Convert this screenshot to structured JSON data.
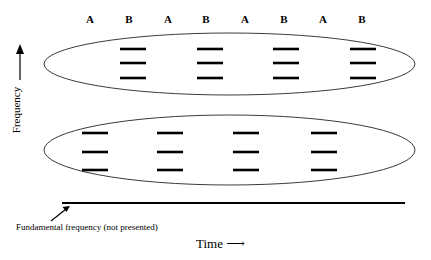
{
  "figure": {
    "type": "diagram",
    "axes": {
      "y_label": "Frequency",
      "y_arrow": "up-arrow",
      "x_label": "Time",
      "x_arrow": "right-arrow",
      "baseline_note": "Fundamental frequency (not presented)",
      "baseline": {
        "x1": 62,
        "x2": 405,
        "y": 203
      }
    },
    "column_labels": [
      {
        "text": "A",
        "x": 90
      },
      {
        "text": "B",
        "x": 129
      },
      {
        "text": "A",
        "x": 168
      },
      {
        "text": "B",
        "x": 206
      },
      {
        "text": "A",
        "x": 245
      },
      {
        "text": "B",
        "x": 284
      },
      {
        "text": "A",
        "x": 323
      },
      {
        "text": "B",
        "x": 362
      }
    ],
    "label_row_y": 14,
    "ellipses": [
      {
        "name": "upper-harmonic-band",
        "cx": 229.5,
        "cy": 64,
        "rx": 185.5,
        "ry": 31
      },
      {
        "name": "lower-harmonic-band",
        "cx": 229.5,
        "cy": 150,
        "rx": 185.5,
        "ry": 35
      }
    ],
    "harmonic_groups": [
      {
        "band": "upper",
        "assigned_label": "B",
        "dash_x_start": 120,
        "dash_length": 26,
        "dash_y": [
          49,
          63,
          78
        ],
        "group_x_starts": [
          120,
          197,
          273,
          350
        ]
      },
      {
        "band": "lower",
        "assigned_label": "A",
        "dash_x_start": 82,
        "dash_length": 26,
        "dash_y": [
          133,
          152,
          170
        ],
        "group_x_starts": [
          82,
          157,
          233,
          311
        ]
      }
    ],
    "pointer_arrow": {
      "name": "fundamental-pointer",
      "x1": 51,
      "y1": 221,
      "x2": 70,
      "y2": 206
    },
    "colors": {
      "ink": "#000000",
      "background": "#ffffff",
      "ellipse_stroke": "#3a3a3a"
    }
  }
}
